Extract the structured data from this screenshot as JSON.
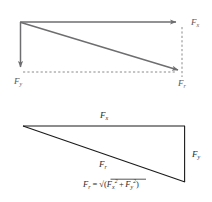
{
  "figure": {
    "colors": {
      "vector_gray": "#6e6e70",
      "dashed_gray": "#8a8a8c",
      "triangle_black": "#1a1a1a",
      "text_gray": "#58585a",
      "text_dark": "#2b2b2b",
      "background": "#ffffff"
    }
  },
  "top_diagram": {
    "name": "vector-decomposition",
    "labels": {
      "fx": {
        "base": "F",
        "sub": "x"
      },
      "fy": {
        "base": "F",
        "sub": "y"
      },
      "fr": {
        "base": "F",
        "sub": "r"
      }
    },
    "vectors": [
      {
        "name": "fx-vector",
        "label": "F_x",
        "from": [
          20,
          22
        ],
        "to": [
          182,
          22
        ],
        "style": "solid-arrow",
        "direction": "right"
      },
      {
        "name": "fy-vector",
        "label": "F_y",
        "from": [
          20,
          22
        ],
        "to": [
          20,
          73
        ],
        "style": "solid-arrow",
        "direction": "down"
      },
      {
        "name": "fr-vector",
        "label": "F_r",
        "from": [
          20,
          22
        ],
        "to": [
          184,
          72
        ],
        "style": "solid-arrow",
        "direction": "down-right"
      }
    ],
    "construction_lines": [
      {
        "name": "dashed-vertical",
        "from": [
          182,
          26
        ],
        "to": [
          182,
          76
        ],
        "style": "dashed"
      },
      {
        "name": "dashed-horizontal",
        "from": [
          22,
          72
        ],
        "to": [
          178,
          72
        ],
        "style": "dashed"
      }
    ]
  },
  "bottom_diagram": {
    "name": "force-triangle",
    "labels": {
      "fx": {
        "base": "F",
        "sub": "x"
      },
      "fy": {
        "base": "F",
        "sub": "y"
      },
      "fr": {
        "base": "F",
        "sub": "r"
      }
    },
    "triangle": {
      "apex_left": [
        23,
        126
      ],
      "corner_top_right": [
        185,
        126
      ],
      "corner_bottom_right": [
        185,
        182
      ]
    },
    "edges": [
      {
        "name": "triangle-top-edge",
        "label": "F_x"
      },
      {
        "name": "triangle-right-edge",
        "label": "F_y"
      },
      {
        "name": "triangle-hypotenuse",
        "label": "F_r"
      }
    ],
    "formula": {
      "name": "resultant-formula",
      "text": "F_r = √(F_x² + F_y²)",
      "parts": {
        "lhs_base": "F",
        "lhs_sub": "r",
        "equals": "=",
        "radical": "√",
        "paren_open": "(",
        "term1_base": "F",
        "term1_sub": "x",
        "term1_sup": "2",
        "plus": "+",
        "term2_base": "F",
        "term2_sub": "y",
        "term2_sup": "2",
        "paren_close": ")"
      }
    }
  }
}
